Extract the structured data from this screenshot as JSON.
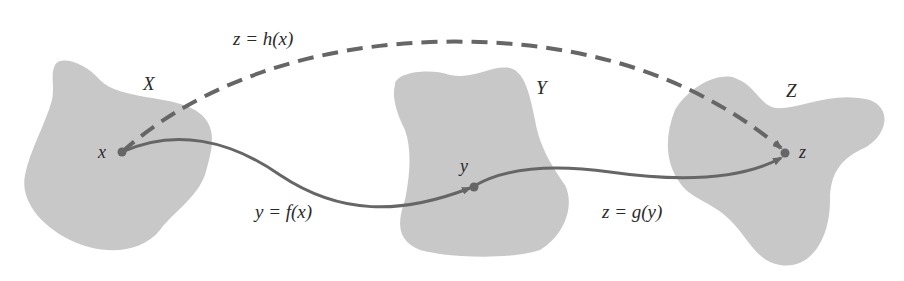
{
  "colors": {
    "background": "#ffffff",
    "set_fill": "#c8c8c8",
    "arrow": "#666666",
    "text": "#2a2a2a"
  },
  "sets": [
    {
      "id": "X",
      "label": "X",
      "point_label": "x"
    },
    {
      "id": "Y",
      "label": "Y",
      "point_label": "y"
    },
    {
      "id": "Z",
      "label": "Z",
      "point_label": "z"
    }
  ],
  "mappings": [
    {
      "id": "f",
      "label": "y = f(x)",
      "from": "x",
      "to": "y",
      "style": "solid"
    },
    {
      "id": "g",
      "label": "z = g(y)",
      "from": "y",
      "to": "z",
      "style": "solid"
    },
    {
      "id": "h",
      "label": "z = h(x)",
      "from": "x",
      "to": "z",
      "style": "dashed"
    }
  ]
}
